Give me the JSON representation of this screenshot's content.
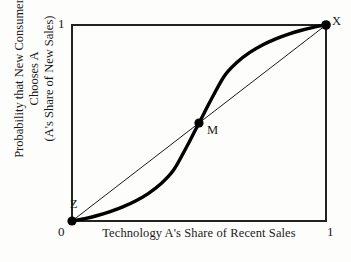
{
  "figure": {
    "axis_x_title": "Technology A's Share of Recent Sales",
    "axis_y_title_line1": "Probability that New Consumer Chooses A",
    "axis_y_title_line2": "(A's Share of New Sales)",
    "tick_x_min": "0",
    "tick_x_max": "1",
    "tick_y_min": "0",
    "tick_y_max": "1",
    "label_point_x": "X",
    "label_point_m": "M",
    "label_point_z": "Z"
  },
  "chart_data": {
    "type": "line",
    "title": "",
    "subtitle": "",
    "xlabel": "Technology A's Share of Recent Sales",
    "ylabel": "Probability that New Consumer Chooses A (A's Share of New Sales)",
    "xlim": [
      0,
      1
    ],
    "ylim": [
      0,
      1
    ],
    "xticks": [
      0,
      1
    ],
    "yticks": [
      0,
      1
    ],
    "xticklabels": [
      "0",
      "1"
    ],
    "yticklabels": [
      "0",
      "1"
    ],
    "grid": false,
    "legend": null,
    "frame": "full-box",
    "series": [
      {
        "name": "Response curve (S-shaped adoption function)",
        "style": "thick-solid",
        "color": "#000000",
        "x": [
          0.0,
          0.05,
          0.1,
          0.15,
          0.2,
          0.25,
          0.3,
          0.35,
          0.4,
          0.45,
          0.48,
          0.5,
          0.52,
          0.55,
          0.6,
          0.65,
          0.7,
          0.75,
          0.8,
          0.85,
          0.9,
          0.95,
          1.0
        ],
        "y": [
          0.0,
          0.012,
          0.028,
          0.048,
          0.072,
          0.102,
          0.14,
          0.19,
          0.26,
          0.375,
          0.45,
          0.5,
          0.55,
          0.625,
          0.74,
          0.81,
          0.86,
          0.898,
          0.928,
          0.952,
          0.972,
          0.988,
          1.0
        ]
      },
      {
        "name": "45-degree line",
        "style": "thin-solid",
        "color": "#000000",
        "x": [
          0,
          1
        ],
        "y": [
          0,
          1
        ]
      }
    ],
    "annotations": [
      {
        "label": "Z",
        "x": 0.0,
        "y": 0.0,
        "marker": "filled-circle",
        "role": "stable equilibrium",
        "label_position": "above-right"
      },
      {
        "label": "M",
        "x": 0.5,
        "y": 0.5,
        "marker": "filled-circle",
        "role": "unstable equilibrium",
        "label_position": "right"
      },
      {
        "label": "X",
        "x": 1.0,
        "y": 1.0,
        "marker": "filled-circle",
        "role": "stable equilibrium",
        "label_position": "above-right"
      }
    ]
  }
}
